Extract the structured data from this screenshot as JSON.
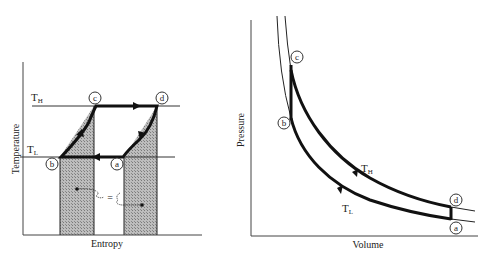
{
  "left_diagram": {
    "title": "Temperature-Entropy diagram",
    "xlabel": "Entropy",
    "ylabel": "Temperature",
    "isotherm_high": {
      "label": "T",
      "sub": "H"
    },
    "isotherm_low": {
      "label": "T",
      "sub": "L"
    },
    "points": {
      "a": "a",
      "b": "b",
      "c": "c",
      "d": "d"
    },
    "equal_annotation": "="
  },
  "right_diagram": {
    "title": "Pressure-Volume diagram",
    "xlabel": "Volume",
    "ylabel": "Pressure",
    "curve_high": {
      "label": "T",
      "sub": "H"
    },
    "curve_low": {
      "label": "T",
      "sub": "L"
    },
    "points": {
      "a": "a",
      "b": "b",
      "c": "c",
      "d": "d"
    }
  },
  "colors": {
    "line": "#111111",
    "shade": "#9a9a9a",
    "axis": "#444444"
  }
}
